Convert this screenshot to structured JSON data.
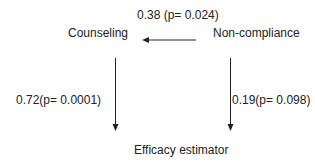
{
  "nodes": {
    "counseling": "Counseling",
    "non_compliance": "Non-compliance",
    "efficacy": "Efficacy estimator"
  },
  "edges": [
    {
      "from": "Non-compliance",
      "to": "Counseling",
      "label": "0.38 (p= 0.024)"
    },
    {
      "from": "Counseling",
      "to": "Efficacy estimator",
      "label": "0.72(p= 0.0001)"
    },
    {
      "from": "Non-compliance",
      "to": "Efficacy estimator",
      "label": "0.19(p= 0.098)"
    }
  ],
  "colors": {
    "line": "#222222",
    "background": "#ffffff"
  }
}
